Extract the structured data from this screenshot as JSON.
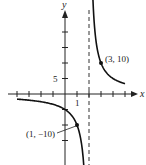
{
  "chart_data": {
    "type": "line",
    "title": "",
    "function": "f(x) = 10/(x - 2)",
    "xlabel": "x",
    "ylabel": "y",
    "xlim": [
      -4.2,
      6
    ],
    "ylim": [
      -24,
      30
    ],
    "grid": false,
    "x_tick_step": 1,
    "y_tick_step": 5,
    "x_tick_labels": [
      {
        "value": 1,
        "label": "1"
      }
    ],
    "y_tick_labels": [
      {
        "value": 5,
        "label": "5"
      }
    ],
    "vertical_asymptote": {
      "x": 2,
      "style": "dashed"
    },
    "horizontal_asymptote": {
      "y": 0
    },
    "series": [
      {
        "name": "left-branch",
        "x": [
          -4,
          -3,
          -2,
          -1,
          0,
          0.5,
          1,
          1.3,
          1.5,
          1.58
        ],
        "values": [
          -1.67,
          -2,
          -2.5,
          -3.33,
          -5,
          -6.67,
          -10,
          -14.3,
          -20,
          -23.8
        ]
      },
      {
        "name": "right-branch",
        "x": [
          2.33,
          2.5,
          3,
          3.5,
          4,
          4.5,
          5
        ],
        "values": [
          30,
          20,
          10,
          6.67,
          5,
          4,
          3.33
        ]
      }
    ],
    "annotations": [
      {
        "point": [
          3,
          10
        ],
        "label": "(3, 10)"
      },
      {
        "point": [
          1,
          -10
        ],
        "label": "(1, −10)"
      }
    ]
  },
  "labels": {
    "x_axis": "x",
    "y_axis": "y",
    "y_tick_5": "5",
    "x_tick_1": "1",
    "point_right": "(3, 10)",
    "point_left": "(1, −10)"
  }
}
